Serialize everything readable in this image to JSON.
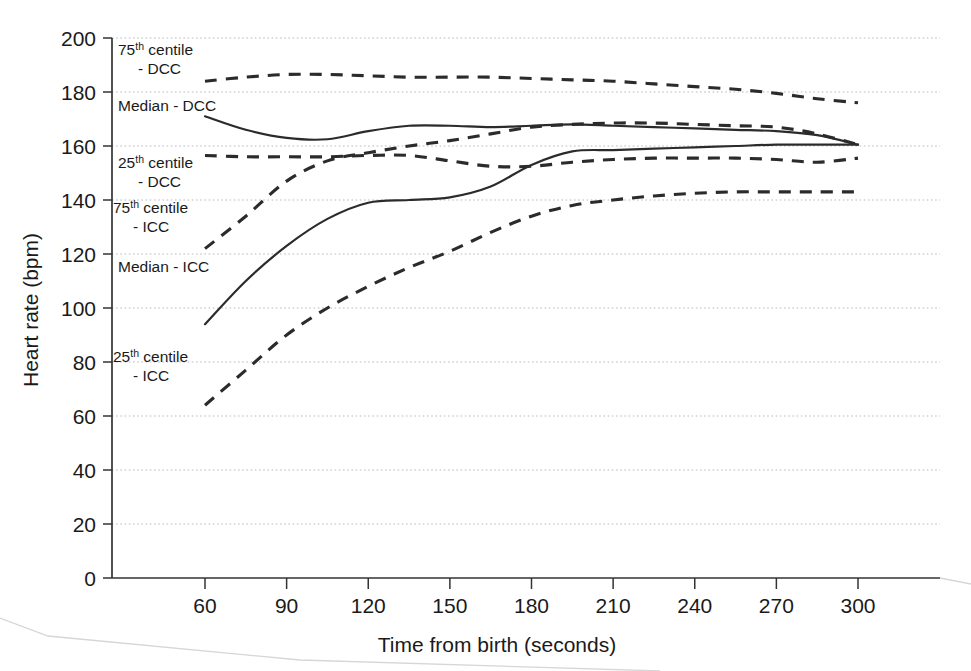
{
  "chart_data": {
    "type": "line",
    "title": "",
    "xlabel": "Time from birth (seconds)",
    "ylabel": "Heart rate (bpm)",
    "xlim": [
      45,
      310
    ],
    "ylim": [
      0,
      200
    ],
    "xticks": [
      "60",
      "90",
      "120",
      "150",
      "180",
      "210",
      "240",
      "270",
      "300"
    ],
    "yticks": [
      "0",
      "20",
      "40",
      "60",
      "80",
      "100",
      "120",
      "140",
      "160",
      "180",
      "200"
    ],
    "grid": true,
    "legend_position": "inline-annotations",
    "x": [
      60,
      75,
      90,
      105,
      120,
      135,
      150,
      165,
      180,
      195,
      210,
      225,
      240,
      255,
      270,
      285,
      300
    ],
    "series": [
      {
        "name": "75th centile - DCC",
        "style": "dashed",
        "label_lines": [
          "75th centile",
          "- DCC"
        ],
        "label_sup": "th",
        "values": [
          184,
          185.5,
          186.5,
          186.5,
          186,
          185.5,
          185.5,
          185.5,
          185,
          184.5,
          184,
          183,
          182,
          181,
          179.5,
          177.5,
          176
        ]
      },
      {
        "name": "Median - DCC",
        "style": "solid",
        "label_lines": [
          "Median - DCC"
        ],
        "label_sup": "",
        "values": [
          171,
          166,
          163,
          162.5,
          165.5,
          167.5,
          167.5,
          167,
          167.5,
          168,
          167.5,
          167,
          166.5,
          166,
          165.5,
          164,
          160.5
        ]
      },
      {
        "name": "25th centile - DCC",
        "style": "dashed",
        "label_lines": [
          "25th centile",
          "- DCC"
        ],
        "label_sup": "th",
        "values": [
          156.5,
          156,
          156,
          156,
          156.5,
          156.5,
          154.5,
          152.5,
          152.5,
          154,
          155,
          155.5,
          155.5,
          155.5,
          155,
          154,
          155.5
        ]
      },
      {
        "name": "75th centile - ICC",
        "style": "dashed",
        "label_lines": [
          "75th centile",
          "- ICC"
        ],
        "label_sup": "th",
        "values": [
          122,
          134,
          147,
          154.5,
          157.5,
          160,
          162,
          164.5,
          167,
          168,
          168.5,
          168.5,
          168,
          167.5,
          167,
          164.5,
          160.5
        ]
      },
      {
        "name": "Median - ICC",
        "style": "solid",
        "label_lines": [
          "Median - ICC"
        ],
        "label_sup": "",
        "values": [
          94,
          110,
          123,
          133,
          139,
          140,
          141,
          145,
          153,
          158,
          158.5,
          159,
          159.5,
          160,
          160.5,
          160.5,
          160.5
        ]
      },
      {
        "name": "25th centile - ICC",
        "style": "dashed",
        "label_lines": [
          "25th centile",
          "- ICC"
        ],
        "label_sup": "th",
        "values": [
          64,
          77,
          90,
          100,
          108,
          115,
          121,
          128,
          134,
          138,
          140,
          141.5,
          142.5,
          143,
          143,
          143,
          143
        ]
      }
    ]
  },
  "annotations": [
    {
      "id": "lbl-75-dcc",
      "line1": "75",
      "sup": "th",
      "line1b": " centile",
      "line2": "- DCC",
      "x": 118,
      "y": 55
    },
    {
      "id": "lbl-median-dcc",
      "line1": "Median - DCC",
      "sup": "",
      "line1b": "",
      "line2": "",
      "x": 118,
      "y": 111
    },
    {
      "id": "lbl-25-dcc",
      "line1": "25",
      "sup": "th",
      "line1b": " centile",
      "line2": "- DCC",
      "x": 118,
      "y": 168
    },
    {
      "id": "lbl-75-icc",
      "line1": "75",
      "sup": "th",
      "line1b": " centile",
      "line2": "- ICC",
      "x": 113,
      "y": 213
    },
    {
      "id": "lbl-median-icc",
      "line1": "Median - ICC",
      "sup": "",
      "line1b": "",
      "line2": "",
      "x": 118,
      "y": 272
    },
    {
      "id": "lbl-25-icc",
      "line1": "25",
      "sup": "th",
      "line1b": " centile",
      "line2": "- ICC",
      "x": 113,
      "y": 362
    }
  ],
  "colors": {
    "ink": "#2b2b2b",
    "axis": "#333333",
    "grid": "#b9b9b9",
    "background": "#ffffff"
  }
}
